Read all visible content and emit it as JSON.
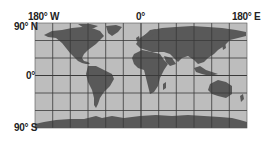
{
  "map": {
    "projection": "equirectangular",
    "colors": {
      "ocean": "#bdbdbd",
      "land": "#595959",
      "grid": "#3a3a3a",
      "text": "#222222"
    },
    "grid_spacing_degrees": 30,
    "labels": {
      "lon_west": "180° W",
      "lon_center": "0°",
      "lon_east": "180° E",
      "lat_north": "90° N",
      "lat_equator": "0°",
      "lat_south": "90° S"
    }
  }
}
